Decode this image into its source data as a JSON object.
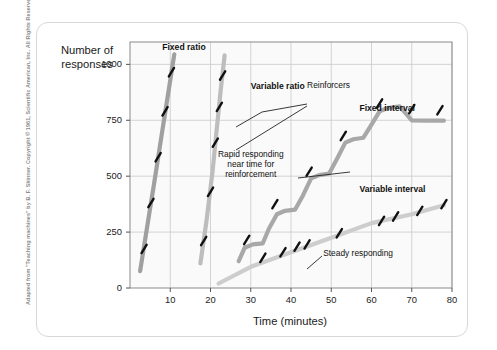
{
  "credit": "Adapted from \"Teaching machines\" by B. F. Skinner. Copyright © 1961, Scientific American, Inc. All Rights Reserved.",
  "chart_data": {
    "type": "line",
    "title": "",
    "xlabel": "Time (minutes)",
    "ylabel": "Number of responses",
    "xlim": [
      0,
      80
    ],
    "ylim": [
      0,
      1100
    ],
    "xticks": [
      10,
      20,
      30,
      40,
      50,
      60,
      70,
      80
    ],
    "yticks": [
      0,
      250,
      500,
      750,
      1000
    ],
    "grid": true,
    "legend_position": "inline-labels",
    "series": [
      {
        "name": "Fixed ratio",
        "color": "#a0a0a0",
        "label_x": 8,
        "label_y": 1075,
        "points": [
          [
            2.5,
            75
          ],
          [
            4.5,
            300
          ],
          [
            6.0,
            470
          ],
          [
            8.0,
            700
          ],
          [
            9.5,
            870
          ],
          [
            11.0,
            1045
          ]
        ],
        "reinforcer_marks": [
          [
            3.5,
            175
          ],
          [
            5.2,
            380
          ],
          [
            7.0,
            585
          ],
          [
            8.7,
            790
          ],
          [
            10.3,
            965
          ]
        ]
      },
      {
        "name": "Variable ratio",
        "color": "#bdbdbd",
        "label_x": 30,
        "label_y": 900,
        "points": [
          [
            17.5,
            110
          ],
          [
            19.0,
            300
          ],
          [
            20.5,
            520
          ],
          [
            21.5,
            700
          ],
          [
            22.5,
            880
          ],
          [
            23.5,
            1040
          ]
        ],
        "reinforcer_marks": [
          [
            18.3,
            210
          ],
          [
            20.0,
            430
          ],
          [
            21.2,
            650
          ],
          [
            22.2,
            810
          ],
          [
            23.0,
            950
          ]
        ]
      },
      {
        "name": "Fixed interval",
        "color": "#a8a8a8",
        "label_x": 57,
        "label_y": 800,
        "points": [
          [
            27.0,
            120
          ],
          [
            28.5,
            180
          ],
          [
            30.5,
            195
          ],
          [
            33.0,
            200
          ],
          [
            34.5,
            265
          ],
          [
            36.5,
            330
          ],
          [
            38.5,
            345
          ],
          [
            41.0,
            350
          ],
          [
            43.0,
            415
          ],
          [
            45.0,
            490
          ],
          [
            47.0,
            505
          ],
          [
            49.5,
            512
          ],
          [
            51.5,
            580
          ],
          [
            53.5,
            650
          ],
          [
            55.5,
            665
          ],
          [
            58.0,
            672
          ],
          [
            60.0,
            730
          ],
          [
            62.0,
            790
          ],
          [
            64.0,
            805
          ],
          [
            67.0,
            812
          ],
          [
            70.0,
            750
          ],
          [
            74.0,
            748
          ],
          [
            78.0,
            748
          ]
        ],
        "reinforcer_marks": [
          [
            29.0,
            215
          ],
          [
            36.0,
            375
          ],
          [
            44.5,
            520
          ],
          [
            53.0,
            680
          ],
          [
            62.0,
            825
          ],
          [
            70.0,
            800
          ],
          [
            77.0,
            795
          ]
        ]
      },
      {
        "name": "Variable interval",
        "color": "#cdcdcd",
        "label_x": 57,
        "label_y": 440,
        "points": [
          [
            22.0,
            20
          ],
          [
            30.0,
            95
          ],
          [
            40.0,
            160
          ],
          [
            50.0,
            225
          ],
          [
            60.0,
            290
          ],
          [
            70.0,
            330
          ],
          [
            78.0,
            370
          ]
        ],
        "reinforcer_marks": [
          [
            33.0,
            135
          ],
          [
            38.0,
            160
          ],
          [
            41.5,
            185
          ],
          [
            44.0,
            195
          ],
          [
            52.0,
            245
          ],
          [
            62.5,
            300
          ],
          [
            66.0,
            320
          ],
          [
            72.0,
            345
          ],
          [
            78.0,
            375
          ]
        ]
      }
    ],
    "annotations": [
      {
        "id": "reinforcers",
        "text": "Reinforcers",
        "x": 44,
        "y": 905
      },
      {
        "id": "rapid-responding",
        "text": "Rapid responding\nnear time for\nreinforcement",
        "x": 30,
        "y": 560
      },
      {
        "id": "steady-responding",
        "text": "Steady responding",
        "x": 48,
        "y": 150
      }
    ]
  },
  "labels": {
    "fixed_ratio": "Fixed ratio",
    "variable_ratio": "Variable ratio",
    "fixed_interval": "Fixed interval",
    "variable_interval": "Variable interval",
    "reinforcers": "Reinforcers",
    "rapid_1": "Rapid responding",
    "rapid_2": "near time for",
    "rapid_3": "reinforcement",
    "steady": "Steady responding"
  },
  "axes": {
    "ylabel_line1": "Number of",
    "ylabel_line2": "responses",
    "xlabel": "Time (minutes)",
    "yticks": [
      "1000",
      "750",
      "500",
      "250",
      "0"
    ],
    "xticks": [
      "10",
      "20",
      "30",
      "40",
      "50",
      "60",
      "70",
      "80"
    ]
  }
}
